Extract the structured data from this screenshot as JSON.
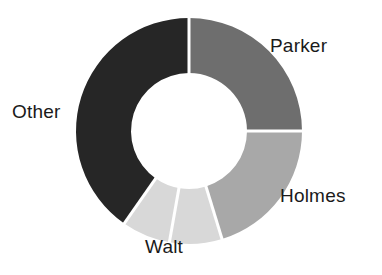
{
  "chart_data": {
    "type": "pie",
    "variant": "donut",
    "title": "",
    "subtitle": "",
    "xlabel": "",
    "ylabel": "",
    "legend_position": "outside-labels",
    "grid": false,
    "start_angle_deg": 0,
    "direction": "clockwise",
    "inner_radius_ratio": 0.513,
    "categories": [
      "Parker",
      "Holmes",
      "Walt",
      "Other"
    ],
    "values": [
      25.0,
      20.3,
      14.4,
      40.3
    ],
    "units": "percent",
    "slices": [
      {
        "label": "Parker",
        "value": 25.0,
        "color": "#6e6e6e",
        "start_angle_deg": 0,
        "end_angle_deg": 90
      },
      {
        "label": "Holmes",
        "value": 20.3,
        "color": "#a8a8a8",
        "start_angle_deg": 90,
        "end_angle_deg": 163
      },
      {
        "label": "Walt",
        "value": 14.4,
        "color": "#d8d8d8",
        "start_angle_deg": 163,
        "end_angle_deg": 215,
        "subdivided": true,
        "subdivision_angle_deg": 190
      },
      {
        "label": "Other",
        "value": 40.3,
        "color": "#262626",
        "start_angle_deg": 215,
        "end_angle_deg": 360
      }
    ],
    "annotations": []
  },
  "labels": {
    "parker": "Parker",
    "holmes": "Holmes",
    "walt": "Walt",
    "other": "Other"
  },
  "colors": {
    "parker": "#6e6e6e",
    "holmes": "#a8a8a8",
    "walt": "#d8d8d8",
    "other": "#262626",
    "background": "#ffffff",
    "separator": "#ffffff",
    "text": "#1a1a1a"
  },
  "geometry": {
    "center_x": 189,
    "center_y": 131,
    "outer_radius": 113,
    "inner_radius": 58,
    "separator_width": 3
  }
}
